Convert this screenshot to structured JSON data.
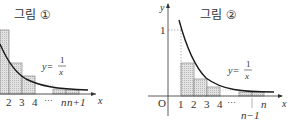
{
  "figure1": {
    "title": "그림 ①",
    "function_label_lhs": "y=",
    "function_num": "1",
    "function_den": "x",
    "x_axis_label": "x",
    "ticks": [
      "2",
      "3",
      "4",
      "⋯",
      "n",
      "n+1"
    ],
    "description": "Upper rectangles (left endpoints) under y=1/x on [1, n+1]"
  },
  "figure2": {
    "title": "그림 ②",
    "function_label_lhs": "y=",
    "function_num": "1",
    "function_den": "x",
    "x_axis_label": "x",
    "y_axis_label": "y",
    "origin_label": "O",
    "y_tick": "1",
    "ticks": [
      "1",
      "2",
      "3",
      "4",
      "⋯",
      "n"
    ],
    "below_label": "n−1",
    "description": "Lower rectangles (right endpoints) under y=1/x on [1, n]"
  },
  "colors": {
    "curve": "#1a1a1a",
    "axis": "#333333",
    "bar_fill": "#d9d9d9",
    "bar_stroke": "#888888",
    "text": "#333333"
  }
}
